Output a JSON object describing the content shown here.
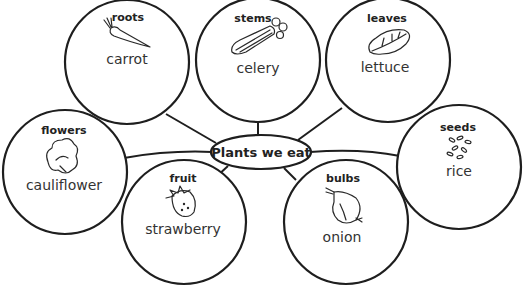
{
  "title": "Plants we eat",
  "colors": {
    "stroke": "#1e1e1e",
    "background": "#ffffff",
    "text": "#333333"
  },
  "nodes": [
    {
      "category": "roots",
      "example": "carrot",
      "icon": "carrot-icon"
    },
    {
      "category": "stems",
      "example": "celery",
      "icon": "celery-icon"
    },
    {
      "category": "leaves",
      "example": "lettuce",
      "icon": "lettuce-leaf-icon"
    },
    {
      "category": "flowers",
      "example": "cauliflower",
      "icon": "cauliflower-icon"
    },
    {
      "category": "fruit",
      "example": "strawberry",
      "icon": "strawberry-icon"
    },
    {
      "category": "bulbs",
      "example": "onion",
      "icon": "onion-icon"
    },
    {
      "category": "seeds",
      "example": "rice",
      "icon": "rice-grains-icon"
    }
  ]
}
